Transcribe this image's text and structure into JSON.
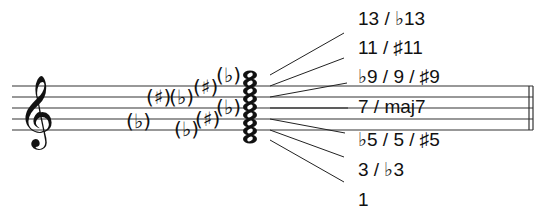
{
  "diagram": {
    "clef": "treble-clef",
    "chord_tones_labels": [
      {
        "id": "thirteenth",
        "text": "13 / ♭13",
        "y": 8
      },
      {
        "id": "eleventh",
        "text": "11 / ♯11",
        "y": 38
      },
      {
        "id": "ninth",
        "text": "♭9 / 9 / ♯9",
        "y": 66
      },
      {
        "id": "seventh",
        "text": "7 / maj7",
        "y": 96
      },
      {
        "id": "fifth",
        "text": "♭5 / 5 / ♯5",
        "y": 130
      },
      {
        "id": "third",
        "text": "3 / ♭3",
        "y": 160
      },
      {
        "id": "root",
        "text": "1",
        "y": 190
      }
    ],
    "accidentals": [
      {
        "glyph": "♭",
        "x": 126,
        "y": 120
      },
      {
        "glyph": "♯",
        "x": 148,
        "y": 96
      },
      {
        "glyph": "♭",
        "x": 170,
        "y": 96
      },
      {
        "glyph": "♭",
        "x": 175,
        "y": 128
      },
      {
        "glyph": "♯",
        "x": 195,
        "y": 86
      },
      {
        "glyph": "♯",
        "x": 197,
        "y": 118
      },
      {
        "glyph": "♭",
        "x": 218,
        "y": 74
      },
      {
        "glyph": "♭",
        "x": 218,
        "y": 106
      }
    ]
  }
}
